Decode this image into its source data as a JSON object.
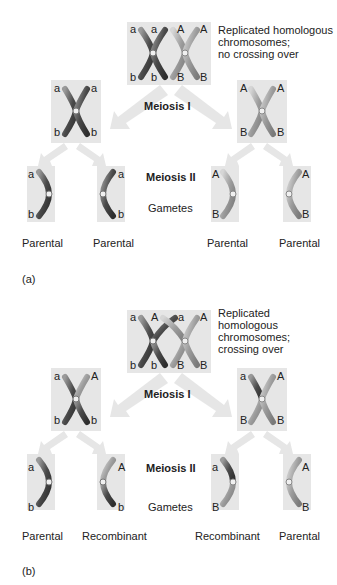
{
  "panel_a": {
    "label": "(a)",
    "note": [
      "Replicated homologous",
      "chromosomes;",
      "no crossing over"
    ],
    "meiosis1": "Meiosis I",
    "meiosis2": "Meiosis II",
    "gametes": "Gametes",
    "top_alleles": {
      "top": [
        "a",
        "a",
        "A",
        "A"
      ],
      "bottom": [
        "b",
        "b",
        "B",
        "B"
      ]
    },
    "mid_left": {
      "top": [
        "a",
        "a"
      ],
      "bottom": [
        "b",
        "b"
      ]
    },
    "mid_right": {
      "top": [
        "A",
        "A"
      ],
      "bottom": [
        "B",
        "B"
      ]
    },
    "gamete_alleles": [
      {
        "top": "a",
        "bottom": "b"
      },
      {
        "top": "a",
        "bottom": "b"
      },
      {
        "top": "A",
        "bottom": "B"
      },
      {
        "top": "A",
        "bottom": "B"
      }
    ],
    "gamete_types": [
      "Parental",
      "Parental",
      "Parental",
      "Parental"
    ]
  },
  "panel_b": {
    "label": "(b)",
    "note": [
      "Replicated",
      "homologous",
      "chromosomes;",
      "crossing over"
    ],
    "meiosis1": "Meiosis I",
    "meiosis2": "Meiosis II",
    "gametes": "Gametes",
    "top_alleles": {
      "top": [
        "a",
        "A",
        "a",
        "A"
      ],
      "bottom": [
        "b",
        "b",
        "B",
        "B"
      ]
    },
    "mid_left": {
      "top": [
        "a",
        "A"
      ],
      "bottom": [
        "b",
        "b"
      ]
    },
    "mid_right": {
      "top": [
        "a",
        "A"
      ],
      "bottom": [
        "B",
        "B"
      ]
    },
    "gamete_alleles": [
      {
        "top": "a",
        "bottom": "b"
      },
      {
        "top": "A",
        "bottom": "b"
      },
      {
        "top": "a",
        "bottom": "B"
      },
      {
        "top": "A",
        "bottom": "B"
      }
    ],
    "gamete_types": [
      "Parental",
      "Recombinant",
      "Recombinant",
      "Parental"
    ]
  },
  "colors": {
    "box_bg": "#e6e6e6",
    "arrow": "#e4e4e4",
    "chrom_dark": "#5a5a5a",
    "chrom_light": "#a8a8a8"
  }
}
